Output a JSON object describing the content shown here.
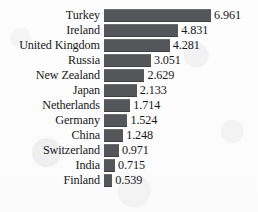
{
  "chart_data": {
    "type": "bar",
    "orientation": "horizontal",
    "title": "",
    "subtitle": "",
    "xlabel": "",
    "ylabel": "",
    "grid": false,
    "legend": null,
    "axis_visible": false,
    "xlim": [
      0,
      6.961
    ],
    "categories": [
      "Turkey",
      "Ireland",
      "United Kingdom",
      "Russia",
      "New Zealand",
      "Japan",
      "Netherlands",
      "Germany",
      "China",
      "Switzerland",
      "India",
      "Finland"
    ],
    "values": [
      6.961,
      4.831,
      4.281,
      3.051,
      2.629,
      2.133,
      1.714,
      1.524,
      1.248,
      0.971,
      0.715,
      0.539
    ],
    "value_labels": [
      "6.961",
      "4.831",
      "4.281",
      "3.051",
      "2.629",
      "2.133",
      "1.714",
      "1.524",
      "1.248",
      "0.971",
      "0.715",
      "0.539"
    ],
    "bar_color": "#55565a",
    "text_color": "#18181a",
    "background_color": "#fdfdfd"
  }
}
